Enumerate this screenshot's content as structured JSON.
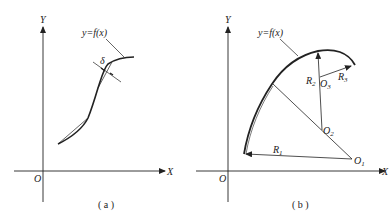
{
  "panel_a": {
    "caption": "( a )",
    "axis_x": "X",
    "axis_y": "Y",
    "origin": "O",
    "curve_label": "y=f(x)",
    "tolerance_label": "δ"
  },
  "panel_b": {
    "caption": "( b )",
    "axis_x": "X",
    "axis_y": "Y",
    "origin": "O",
    "curve_label": "y=f(x)",
    "radius_labels": [
      "R",
      "R",
      "R"
    ],
    "radius_subs": [
      "1",
      "2",
      "3"
    ],
    "center_labels": [
      "O",
      "O",
      "O"
    ],
    "center_subs": [
      "1",
      "2",
      "3"
    ]
  },
  "colors": {
    "ink": "#222222",
    "background": "#ffffff"
  }
}
